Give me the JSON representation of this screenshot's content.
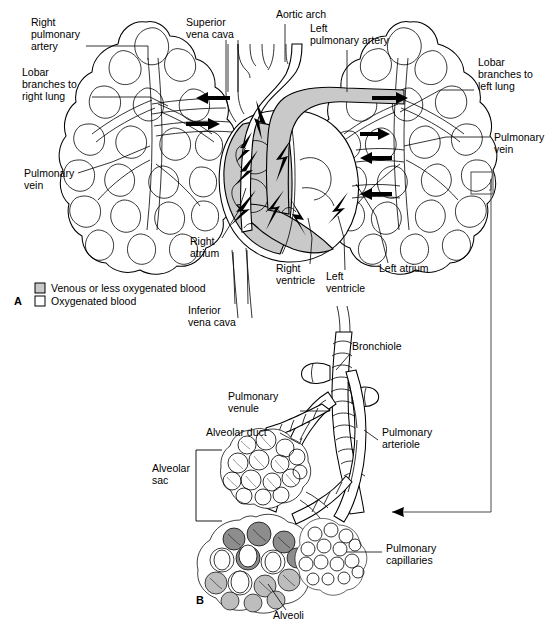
{
  "figure": {
    "panels": [
      {
        "id": "A",
        "letter": "A"
      },
      {
        "id": "B",
        "letter": "B"
      }
    ]
  },
  "panel_a": {
    "letter": "A",
    "labels": {
      "right_pulmonary_artery": "Right\npulmonary\nartery",
      "right_pulmonary_artery_lines": [
        "Right",
        "pulmonary",
        "artery"
      ],
      "lobar_branches_right": [
        "Lobar",
        "branches to",
        "right lung"
      ],
      "pulmonary_vein_left_side": [
        "Pulmonary",
        "vein"
      ],
      "superior_vena_cava": [
        "Superior",
        "vena cava"
      ],
      "aortic_arch": [
        "Aortic arch"
      ],
      "left_pulmonary_artery": [
        "Left",
        "pulmonary artery"
      ],
      "lobar_branches_left": [
        "Lobar",
        "branches to",
        "left lung"
      ],
      "pulmonary_vein_right_side": [
        "Pulmonary",
        "vein"
      ],
      "right_atrium": [
        "Right",
        "atrium"
      ],
      "inferior_vena_cava": [
        "Inferior",
        "vena cava"
      ],
      "right_ventricle": [
        "Right",
        "ventricle"
      ],
      "left_ventricle": [
        "Left",
        "ventricle"
      ],
      "left_atrium": [
        "Left atrium"
      ]
    },
    "legend": {
      "items": [
        {
          "swatch": "gray",
          "label": "Venous or less oxygenated blood",
          "color": "#c9c9c9"
        },
        {
          "swatch": "white",
          "label": "Oxygenated blood",
          "color": "#ffffff"
        }
      ]
    }
  },
  "panel_b": {
    "letter": "B",
    "labels": {
      "bronchiole": [
        "Bronchiole"
      ],
      "pulmonary_venule": [
        "Pulmonary",
        "venule"
      ],
      "alveolar_duct": [
        "Alveolar duct"
      ],
      "pulmonary_arteriole": [
        "Pulmonary",
        "arteriole"
      ],
      "alveolar_sac": [
        "Alveolar",
        "sac"
      ],
      "pulmonary_capillaries": [
        "Pulmonary",
        "capillaries"
      ],
      "alveoli": [
        "Alveoli"
      ]
    }
  },
  "colors": {
    "deoxygenated_fill": "#c9c9c9",
    "oxygenated_fill": "#ffffff",
    "stroke": "#000000",
    "connector": "#4a4a4a",
    "background": "#ffffff"
  }
}
